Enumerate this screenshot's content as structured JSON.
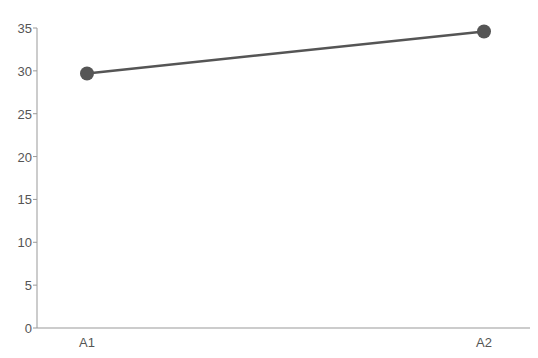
{
  "chart_data": {
    "type": "line",
    "title": "",
    "xlabel": "",
    "ylabel": "",
    "categories": [
      "A1",
      "A2"
    ],
    "series": [
      {
        "name": "",
        "values": [
          29.7,
          34.6
        ],
        "color": "#555555"
      }
    ],
    "ylim": [
      0,
      35
    ],
    "yticks": [
      0,
      5,
      10,
      15,
      20,
      25,
      30,
      35
    ],
    "ytick_labels": [
      "0",
      "5",
      "10",
      "15",
      "20",
      "25",
      "30",
      "35"
    ],
    "grid": false,
    "legend": "none",
    "marker": "circle"
  },
  "labels": {
    "y": [
      "0",
      "5",
      "10",
      "15",
      "20",
      "25",
      "30",
      "35"
    ],
    "x": [
      "A1",
      "A2"
    ]
  }
}
